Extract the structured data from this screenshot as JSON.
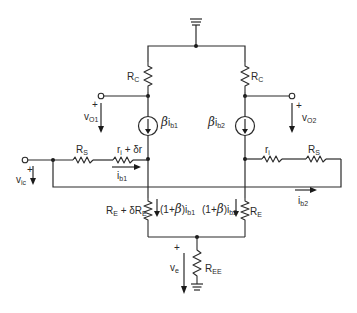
{
  "diagram": {
    "type": "differential-amplifier-small-signal-model",
    "labels": {
      "rc_left": "R",
      "rc_left_sub": "C",
      "rc_right": "R",
      "rc_right_sub": "C",
      "vo1": "v",
      "vo1_sub": "O1",
      "vo2": "v",
      "vo2_sub": "O2",
      "plus": "+",
      "src1_beta": "β",
      "src1_text": "i",
      "src1_sub": "b1",
      "src2_beta": "β",
      "src2_text": "i",
      "src2_sub": "b2",
      "rs_left": "R",
      "rs_left_sub": "S",
      "ri_left": "r",
      "ri_left_sub": "i",
      "ri_left_extra": " + δr",
      "ib1": "i",
      "ib1_sub": "b1",
      "vic": "v",
      "vic_sub": "ic",
      "ri_right": "r",
      "ri_right_sub": "i",
      "rs_right": "R",
      "rs_right_sub": "S",
      "ib2": "i",
      "ib2_sub": "b2",
      "re_left": "R",
      "re_left_sub": "E",
      "re_left_extra": " + δR",
      "re_left_extra_sub": "E",
      "i_left_pre": "(1+",
      "i_left_beta": "β",
      "i_left_post": ")i",
      "i_left_sub": "b1",
      "i_right_pre": "(1+",
      "i_right_beta": "β",
      "i_right_post": ")i",
      "i_right_sub": "b2",
      "re_right": "R",
      "re_right_sub": "E",
      "ve": "v",
      "ve_sub": "e",
      "ree": "R",
      "ree_sub": "EE"
    }
  }
}
